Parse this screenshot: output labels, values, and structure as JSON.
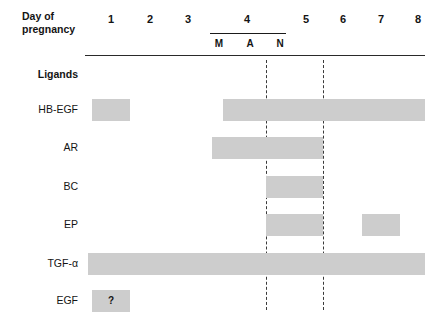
{
  "figure": {
    "axis_title_line1": "Day of",
    "axis_title_line2": "pregnancy",
    "bar_color": "#cdcdcd",
    "line_color": "#2a2a2a",
    "dashed_line_color": "#3a3a3a"
  },
  "x_axis": {
    "day_labels": [
      {
        "label": "1",
        "x": 111
      },
      {
        "label": "2",
        "x": 150
      },
      {
        "label": "3",
        "x": 188
      },
      {
        "label": "4",
        "x": 247
      },
      {
        "label": "5",
        "x": 306
      },
      {
        "label": "6",
        "x": 343
      },
      {
        "label": "7",
        "x": 381
      },
      {
        "label": "8",
        "x": 418
      }
    ],
    "day4_subdivisions": [
      {
        "label": "M",
        "x": 219
      },
      {
        "label": "A",
        "x": 250
      },
      {
        "label": "N",
        "x": 280
      }
    ],
    "day4_bracket": {
      "left": 210,
      "width": 76
    },
    "axis_rule": {
      "left": 85,
      "width": 340
    }
  },
  "dashed_lines": [
    {
      "name": "implantation-marker-1",
      "x": 266,
      "top": 60,
      "height": 250
    },
    {
      "name": "implantation-marker-2",
      "x": 323,
      "top": 60,
      "height": 250
    }
  ],
  "rows": [
    {
      "name": "ligands-header",
      "label": "Ligands",
      "y": 75,
      "header": true,
      "bars": []
    },
    {
      "name": "hb-egf",
      "label": "HB-EGF",
      "y": 110,
      "header": false,
      "bars": [
        {
          "left": 92,
          "width": 38,
          "mark": ""
        },
        {
          "left": 223,
          "width": 202,
          "mark": ""
        }
      ]
    },
    {
      "name": "ar",
      "label": "AR",
      "y": 148,
      "header": false,
      "bars": [
        {
          "left": 212,
          "width": 111,
          "mark": ""
        }
      ]
    },
    {
      "name": "bc",
      "label": "BC",
      "y": 187,
      "header": false,
      "bars": [
        {
          "left": 266,
          "width": 57,
          "mark": ""
        }
      ]
    },
    {
      "name": "ep",
      "label": "EP",
      "y": 225,
      "header": false,
      "bars": [
        {
          "left": 266,
          "width": 57,
          "mark": ""
        },
        {
          "left": 362,
          "width": 38,
          "mark": ""
        }
      ]
    },
    {
      "name": "tgf-alpha",
      "label": "TGF-α",
      "y": 264,
      "header": false,
      "bars": [
        {
          "left": 88,
          "width": 337,
          "mark": ""
        }
      ]
    },
    {
      "name": "egf",
      "label": "EGF",
      "y": 301,
      "header": false,
      "bars": [
        {
          "left": 92,
          "width": 38,
          "mark": "?"
        }
      ]
    }
  ],
  "chart_data": {
    "type": "table",
    "title": "",
    "xlabel": "Day of pregnancy",
    "ylabel": "Ligands",
    "x_categories": [
      "1",
      "2",
      "3",
      "4 M",
      "4 A",
      "4 N",
      "5",
      "6",
      "7",
      "8"
    ],
    "series": [
      {
        "name": "HB-EGF",
        "spans": [
          [
            "1",
            "1"
          ],
          [
            "4 M",
            "8"
          ]
        ]
      },
      {
        "name": "AR",
        "spans": [
          [
            "4 M",
            "5"
          ]
        ]
      },
      {
        "name": "BC",
        "spans": [
          [
            "4 N",
            "5"
          ]
        ]
      },
      {
        "name": "EP",
        "spans": [
          [
            "4 N",
            "5"
          ],
          [
            "7",
            "7"
          ]
        ]
      },
      {
        "name": "TGF-α",
        "spans": [
          [
            "1",
            "8"
          ]
        ]
      },
      {
        "name": "EGF",
        "spans": [
          [
            "1",
            "1"
          ]
        ],
        "annotation": "?"
      }
    ],
    "markers": [
      "implantation-marker-1",
      "implantation-marker-2"
    ],
    "grid": false,
    "legend": "none"
  }
}
